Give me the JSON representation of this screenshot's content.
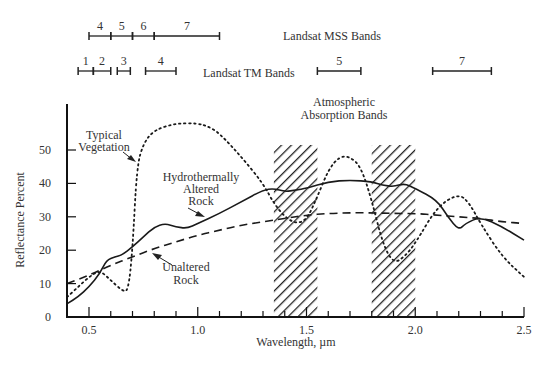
{
  "chart_data": {
    "type": "line",
    "title": "",
    "xlabel": "Wavelength, µm",
    "ylabel": "Reflectance Percent",
    "xlim": [
      0.4,
      2.5
    ],
    "ylim": [
      0,
      60
    ],
    "x_ticks": [
      "0.5",
      "1.0",
      "1.5",
      "2.0",
      "2.5"
    ],
    "y_ticks": [
      "0",
      "10",
      "20",
      "30",
      "40",
      "50"
    ],
    "grid": false,
    "series": [
      {
        "name": "Typical Vegetation",
        "style": "dotted",
        "points": [
          [
            0.4,
            6
          ],
          [
            0.45,
            9
          ],
          [
            0.5,
            12
          ],
          [
            0.55,
            14
          ],
          [
            0.6,
            11
          ],
          [
            0.65,
            8
          ],
          [
            0.68,
            7.5
          ],
          [
            0.7,
            20
          ],
          [
            0.72,
            45
          ],
          [
            0.75,
            52
          ],
          [
            0.8,
            56
          ],
          [
            0.9,
            58
          ],
          [
            1.0,
            58
          ],
          [
            1.05,
            57
          ],
          [
            1.1,
            55
          ],
          [
            1.2,
            48
          ],
          [
            1.3,
            40
          ],
          [
            1.35,
            34
          ],
          [
            1.4,
            30
          ],
          [
            1.45,
            28
          ],
          [
            1.5,
            29
          ],
          [
            1.55,
            36
          ],
          [
            1.6,
            44
          ],
          [
            1.65,
            48
          ],
          [
            1.7,
            48
          ],
          [
            1.75,
            45
          ],
          [
            1.8,
            35
          ],
          [
            1.85,
            22
          ],
          [
            1.9,
            16
          ],
          [
            1.95,
            18
          ],
          [
            2.0,
            22
          ],
          [
            2.1,
            33
          ],
          [
            2.2,
            37
          ],
          [
            2.25,
            34
          ],
          [
            2.3,
            28
          ],
          [
            2.4,
            18
          ],
          [
            2.5,
            12
          ]
        ]
      },
      {
        "name": "Hydrothermally Altered Rock",
        "style": "solid",
        "points": [
          [
            0.4,
            4
          ],
          [
            0.45,
            6
          ],
          [
            0.5,
            9
          ],
          [
            0.55,
            13
          ],
          [
            0.58,
            17
          ],
          [
            0.62,
            18
          ],
          [
            0.65,
            18.5
          ],
          [
            0.7,
            21
          ],
          [
            0.75,
            24
          ],
          [
            0.8,
            27
          ],
          [
            0.85,
            28
          ],
          [
            0.9,
            27
          ],
          [
            0.95,
            26.5
          ],
          [
            1.0,
            28
          ],
          [
            1.1,
            31
          ],
          [
            1.2,
            34.5
          ],
          [
            1.3,
            38
          ],
          [
            1.35,
            38.5
          ],
          [
            1.4,
            37.5
          ],
          [
            1.45,
            38
          ],
          [
            1.5,
            38.5
          ],
          [
            1.6,
            40.5
          ],
          [
            1.7,
            41
          ],
          [
            1.8,
            40.5
          ],
          [
            1.85,
            39.5
          ],
          [
            1.9,
            39
          ],
          [
            1.95,
            40
          ],
          [
            2.0,
            38.5
          ],
          [
            2.1,
            35
          ],
          [
            2.15,
            30
          ],
          [
            2.2,
            26
          ],
          [
            2.23,
            28
          ],
          [
            2.3,
            30
          ],
          [
            2.4,
            27
          ],
          [
            2.5,
            23
          ]
        ]
      },
      {
        "name": "Unaltered Rock",
        "style": "dashed",
        "points": [
          [
            0.4,
            10
          ],
          [
            0.5,
            12.5
          ],
          [
            0.6,
            15.5
          ],
          [
            0.7,
            18
          ],
          [
            0.8,
            20.5
          ],
          [
            0.9,
            22.5
          ],
          [
            1.0,
            24.5
          ],
          [
            1.1,
            26
          ],
          [
            1.2,
            27.5
          ],
          [
            1.3,
            28.5
          ],
          [
            1.4,
            29.5
          ],
          [
            1.5,
            30.5
          ],
          [
            1.6,
            31
          ],
          [
            1.7,
            31.2
          ],
          [
            1.8,
            31.2
          ],
          [
            1.9,
            31
          ],
          [
            2.0,
            31
          ],
          [
            2.1,
            30.5
          ],
          [
            2.2,
            30
          ],
          [
            2.3,
            29.5
          ],
          [
            2.4,
            28.5
          ],
          [
            2.5,
            28
          ]
        ]
      }
    ],
    "absorption_bands": [
      {
        "from": 1.35,
        "to": 1.55
      },
      {
        "from": 1.8,
        "to": 2.0
      }
    ],
    "annotations": [
      {
        "text": "Typical\nVegetation",
        "points_to": [
          0.71,
          45
        ]
      },
      {
        "text": "Hydrothermally\nAltered\nRock",
        "points_to": [
          1.15,
          30
        ]
      },
      {
        "text": "Unaltered\nRock",
        "points_to": [
          0.88,
          22
        ]
      },
      {
        "text": "Atmospheric\nAbsorption Bands"
      }
    ],
    "band_rows": [
      {
        "name": "Landsat MSS Bands",
        "bands": [
          {
            "label": "4",
            "from": 0.5,
            "to": 0.6
          },
          {
            "label": "5",
            "from": 0.6,
            "to": 0.7
          },
          {
            "label": "6",
            "from": 0.7,
            "to": 0.8
          },
          {
            "label": "7",
            "from": 0.8,
            "to": 1.1
          }
        ]
      },
      {
        "name": "Landsat TM Bands",
        "bands": [
          {
            "label": "1",
            "from": 0.45,
            "to": 0.52
          },
          {
            "label": "2",
            "from": 0.52,
            "to": 0.6
          },
          {
            "label": "3",
            "from": 0.63,
            "to": 0.69
          },
          {
            "label": "4",
            "from": 0.76,
            "to": 0.9
          },
          {
            "label": "5",
            "from": 1.55,
            "to": 1.75
          },
          {
            "label": "7",
            "from": 2.08,
            "to": 2.35
          }
        ]
      }
    ],
    "legend_position": "none (inline annotations)"
  },
  "labels": {
    "ylabel": "Reflectance Percent",
    "xlabel": "Wavelength, µm",
    "mss": "Landsat MSS Bands",
    "tm": "Landsat TM Bands",
    "absorption_1": "Atmospheric",
    "absorption_2": "Absorption Bands",
    "veg_1": "Typical",
    "veg_2": "Vegetation",
    "hyd_1": "Hydrothermally",
    "hyd_2": "Altered",
    "hyd_3": "Rock",
    "unalt_1": "Unaltered",
    "unalt_2": "Rock"
  }
}
